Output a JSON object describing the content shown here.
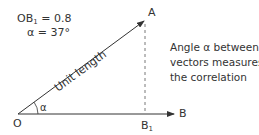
{
  "values": {
    "ob1_label": "OB",
    "ob1_sub": "1",
    "ob1_value": " = 0.8",
    "alpha_line": "α = 37°"
  },
  "points": {
    "origin": "O",
    "a": "A",
    "b": "B",
    "b1_main": "B",
    "b1_sub": "1"
  },
  "vector_oa_label": "Unit length",
  "angle_label": "α",
  "caption": {
    "line1": "Angle α between",
    "line2": "vectors measures",
    "line3": "the correlation"
  },
  "colors": {
    "line": "#333333",
    "dashed": "#555555",
    "text": "#333333"
  }
}
